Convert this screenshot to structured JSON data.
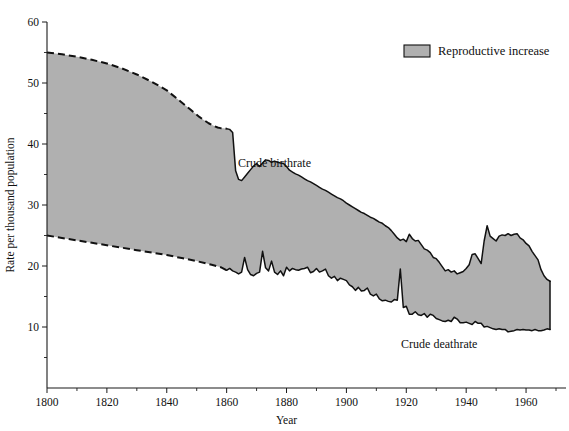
{
  "chart_data": {
    "type": "area",
    "title": "",
    "xlabel": "Year",
    "ylabel": "Rate per thousand population",
    "xlim": [
      1800,
      1970
    ],
    "ylim": [
      0,
      60
    ],
    "grid": false,
    "legend_position": "top-right",
    "xticks": [
      1800,
      1820,
      1840,
      1860,
      1880,
      1900,
      1920,
      1940,
      1960
    ],
    "xtick_labels": [
      "1800",
      "1820",
      "1840",
      "1860",
      "1880",
      "1900",
      "1920",
      "1940",
      "1960"
    ],
    "xticks_minor": [
      1810,
      1830,
      1850,
      1870,
      1890,
      1910,
      1930,
      1950,
      1970
    ],
    "yticks": [
      0,
      10,
      20,
      30,
      40,
      50,
      60
    ],
    "ytick_labels": [
      "",
      "10",
      "20",
      "30",
      "40",
      "50",
      "60"
    ],
    "yticks_minor": [
      5,
      15,
      25,
      35,
      45,
      55
    ],
    "band_color": "#b0b0b0",
    "line_color": "#111111",
    "legend": [
      {
        "label": "Reproductive increase",
        "color": "#b0b0b0"
      }
    ],
    "annotations": [
      {
        "text": "Crude birthrate",
        "x": 1876,
        "y": 36.2
      },
      {
        "text": "Crude deathrate",
        "x": 1931,
        "y": 6.6
      }
    ],
    "series": [
      {
        "name": "Crude birthrate",
        "estimated_until": 1860,
        "x": [
          1800,
          1805,
          1810,
          1815,
          1820,
          1825,
          1830,
          1835,
          1840,
          1844,
          1848,
          1851,
          1854,
          1856,
          1857,
          1858,
          1859,
          1860,
          1861,
          1862,
          1863,
          1864,
          1865,
          1866,
          1867,
          1868,
          1869,
          1870,
          1871,
          1872,
          1873,
          1874,
          1875,
          1876,
          1877,
          1878,
          1879,
          1880,
          1881,
          1882,
          1883,
          1884,
          1885,
          1886,
          1887,
          1888,
          1889,
          1890,
          1891,
          1892,
          1893,
          1894,
          1895,
          1896,
          1897,
          1898,
          1899,
          1900,
          1901,
          1902,
          1903,
          1904,
          1905,
          1906,
          1907,
          1908,
          1909,
          1910,
          1911,
          1912,
          1913,
          1914,
          1915,
          1916,
          1917,
          1918,
          1919,
          1920,
          1921,
          1922,
          1923,
          1924,
          1925,
          1926,
          1927,
          1928,
          1929,
          1930,
          1931,
          1932,
          1933,
          1934,
          1935,
          1936,
          1937,
          1938,
          1939,
          1940,
          1941,
          1942,
          1943,
          1944,
          1945,
          1946,
          1947,
          1948,
          1949,
          1950,
          1951,
          1952,
          1953,
          1954,
          1955,
          1956,
          1957,
          1958,
          1959,
          1960,
          1961,
          1962,
          1963,
          1964,
          1965,
          1966,
          1967,
          1968
        ],
        "y": [
          55.0,
          54.7,
          54.3,
          53.8,
          53.2,
          52.4,
          51.4,
          50.2,
          48.8,
          47.2,
          45.6,
          44.4,
          43.4,
          42.9,
          42.7,
          42.6,
          42.6,
          42.5,
          42.4,
          41.9,
          35.6,
          34.2,
          34.0,
          34.6,
          35.2,
          35.8,
          36.4,
          36.8,
          36.3,
          36.9,
          37.4,
          37.3,
          37.0,
          37.2,
          37.0,
          36.9,
          36.8,
          36.3,
          35.7,
          35.4,
          35.1,
          34.9,
          34.6,
          34.3,
          34.0,
          33.8,
          33.5,
          33.2,
          32.9,
          32.6,
          32.4,
          32.1,
          31.8,
          31.5,
          31.2,
          31.0,
          30.7,
          30.3,
          30.0,
          29.7,
          29.4,
          29.1,
          28.8,
          28.6,
          28.3,
          28.0,
          27.8,
          27.5,
          27.2,
          27.0,
          26.6,
          26.3,
          25.8,
          25.2,
          24.6,
          24.2,
          24.4,
          24.0,
          25.2,
          24.5,
          24.1,
          24.2,
          23.5,
          22.8,
          22.6,
          22.2,
          21.4,
          21.2,
          20.6,
          19.9,
          19.2,
          19.4,
          19.0,
          19.2,
          18.7,
          18.9,
          19.1,
          19.6,
          20.2,
          21.9,
          22.0,
          21.2,
          20.4,
          24.1,
          26.6,
          24.9,
          24.5,
          24.1,
          24.9,
          25.1,
          25.0,
          25.3,
          25.0,
          25.2,
          25.3,
          24.6,
          24.3,
          23.7,
          23.3,
          22.4,
          21.7,
          21.0,
          19.4,
          18.4,
          17.8,
          17.5
        ]
      },
      {
        "name": "Crude deathrate",
        "estimated_until": 1860,
        "x": [
          1800,
          1805,
          1810,
          1815,
          1820,
          1825,
          1830,
          1835,
          1840,
          1845,
          1850,
          1855,
          1858,
          1860,
          1861,
          1862,
          1863,
          1864,
          1865,
          1866,
          1867,
          1868,
          1869,
          1870,
          1871,
          1872,
          1873,
          1874,
          1875,
          1876,
          1877,
          1878,
          1879,
          1880,
          1881,
          1882,
          1883,
          1884,
          1885,
          1886,
          1887,
          1888,
          1889,
          1890,
          1891,
          1892,
          1893,
          1894,
          1895,
          1896,
          1897,
          1898,
          1899,
          1900,
          1901,
          1902,
          1903,
          1904,
          1905,
          1906,
          1907,
          1908,
          1909,
          1910,
          1911,
          1912,
          1913,
          1914,
          1915,
          1916,
          1917,
          1918,
          1919,
          1920,
          1921,
          1922,
          1923,
          1924,
          1925,
          1926,
          1927,
          1928,
          1929,
          1930,
          1931,
          1932,
          1933,
          1934,
          1935,
          1936,
          1937,
          1938,
          1939,
          1940,
          1941,
          1942,
          1943,
          1944,
          1945,
          1946,
          1947,
          1948,
          1949,
          1950,
          1951,
          1952,
          1953,
          1954,
          1955,
          1956,
          1957,
          1958,
          1959,
          1960,
          1961,
          1962,
          1963,
          1964,
          1965,
          1966,
          1967,
          1968
        ],
        "y": [
          25.0,
          24.6,
          24.2,
          23.8,
          23.4,
          23.0,
          22.6,
          22.2,
          21.8,
          21.3,
          20.8,
          20.2,
          19.8,
          19.3,
          19.6,
          19.2,
          19.0,
          18.7,
          19.0,
          21.4,
          19.4,
          18.6,
          18.4,
          18.8,
          19.0,
          22.4,
          19.7,
          19.2,
          20.8,
          19.0,
          18.6,
          19.2,
          18.4,
          19.8,
          19.2,
          19.6,
          19.4,
          19.3,
          19.5,
          19.6,
          19.8,
          18.9,
          19.1,
          19.6,
          19.0,
          19.2,
          19.5,
          18.4,
          18.0,
          18.3,
          17.6,
          18.0,
          17.8,
          17.6,
          16.9,
          16.6,
          16.0,
          16.5,
          15.9,
          16.0,
          16.4,
          15.4,
          15.1,
          15.4,
          14.6,
          14.3,
          14.4,
          14.2,
          14.1,
          14.5,
          14.4,
          19.5,
          13.2,
          13.4,
          12.1,
          12.1,
          12.5,
          12.0,
          11.9,
          12.2,
          11.6,
          12.1,
          11.9,
          11.4,
          11.2,
          11.0,
          10.9,
          11.1,
          10.9,
          11.6,
          11.3,
          10.7,
          10.7,
          10.8,
          10.6,
          10.4,
          10.9,
          10.6,
          10.6,
          10.0,
          10.1,
          9.9,
          9.7,
          9.6,
          9.7,
          9.6,
          9.6,
          9.2,
          9.3,
          9.4,
          9.6,
          9.5,
          9.6,
          9.5,
          9.5,
          9.4,
          9.6,
          9.4,
          9.4,
          9.5,
          9.7,
          9.6
        ]
      }
    ]
  }
}
